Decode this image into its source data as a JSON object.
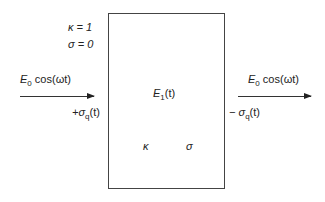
{
  "params": {
    "kappa_label": "κ = 1",
    "sigma_label": "σ = 0"
  },
  "incident": {
    "E_symbol": "E",
    "E_sub": "0",
    "func": "cos(ωt)"
  },
  "transmitted": {
    "E_symbol": "E",
    "E_sub": "0",
    "func": "cos(ωt)"
  },
  "slab": {
    "field_symbol": "E",
    "field_sub": "1",
    "field_arg": "(t)",
    "kappa": "κ",
    "sigma": "σ"
  },
  "charges": {
    "left_prefix": "+σ",
    "left_sub": "q",
    "left_arg": "(t)",
    "right_prefix": "− σ",
    "right_sub": "q",
    "right_arg": "(t)"
  }
}
